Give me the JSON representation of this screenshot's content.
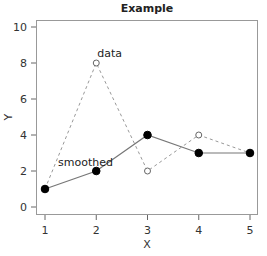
{
  "chart_data": {
    "type": "line",
    "title": "Example",
    "xlabel": "X",
    "ylabel": "Y",
    "x": [
      1,
      2,
      3,
      4,
      5
    ],
    "xticks": [
      1,
      2,
      3,
      4,
      5
    ],
    "yticks": [
      0,
      2,
      4,
      6,
      8,
      10
    ],
    "xlim": [
      0.95,
      5.05
    ],
    "ylim": [
      -0.4,
      10.4
    ],
    "grid": false,
    "legend": "none",
    "series": [
      {
        "name": "data",
        "values": [
          1,
          8,
          2,
          4,
          3
        ],
        "style": "dashed",
        "marker": "open-circle",
        "color": "#999999"
      },
      {
        "name": "smoothed",
        "values": [
          1,
          2,
          4,
          3,
          3
        ],
        "style": "solid",
        "marker": "filled-circle",
        "color": "#777777"
      }
    ],
    "annotations": [
      {
        "text": "data",
        "x": 2,
        "y": 8
      },
      {
        "text": "smoothed",
        "x": 1.1,
        "y": 2.4
      }
    ]
  }
}
